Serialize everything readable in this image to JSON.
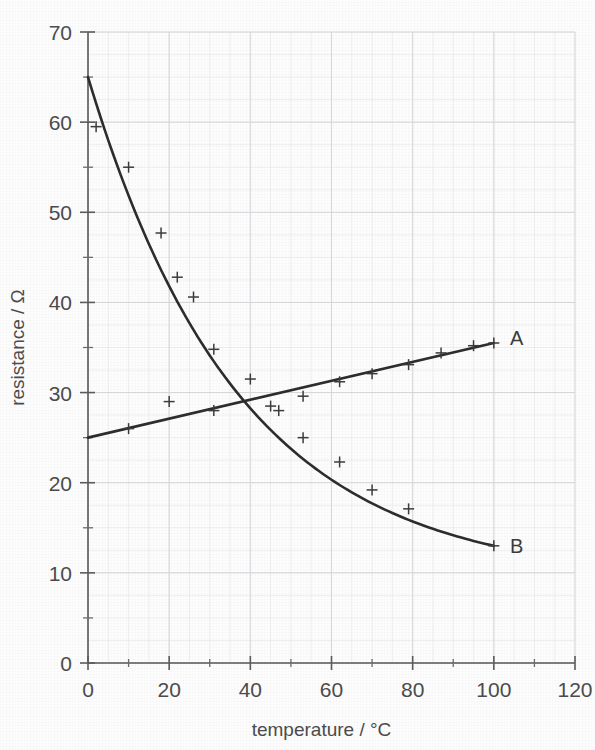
{
  "figure": {
    "background_color": "#fdfdfd",
    "ink_color": "#2b2b2b",
    "axis_color": "#5a5a5a",
    "grid_color": "#d8d8dc"
  },
  "chart_data": {
    "type": "scatter",
    "title": "",
    "subtitle": "",
    "xlabel": "temperature / °C",
    "ylabel": "resistance / Ω",
    "xlim": [
      0,
      120
    ],
    "ylim": [
      0,
      70
    ],
    "xticks": [
      0,
      20,
      40,
      60,
      80,
      100,
      120
    ],
    "xticklabels": [
      "0",
      "20",
      "40",
      "60",
      "80",
      "100",
      "120"
    ],
    "yticks": [
      0,
      10,
      20,
      30,
      40,
      50,
      60,
      70
    ],
    "yticklabels": [
      "0",
      "10",
      "20",
      "30",
      "40",
      "50",
      "60",
      "70"
    ],
    "x_minor_tick_step": 10,
    "y_minor_tick_step": 5,
    "grid": true,
    "grid_style": "faint graph paper",
    "legend": "inline end-of-curve labels",
    "annotations": [
      {
        "text": "A",
        "x": 104,
        "y": 36,
        "series": "A"
      },
      {
        "text": "B",
        "x": 104,
        "y": 13,
        "series": "B"
      }
    ],
    "series": [
      {
        "name": "A",
        "label": "A",
        "marker": "plus",
        "fit": "linear",
        "fit_endpoints": [
          [
            0,
            25.0
          ],
          [
            100,
            35.5
          ]
        ],
        "points": [
          {
            "x": 10,
            "y": 26.0
          },
          {
            "x": 20,
            "y": 29.0
          },
          {
            "x": 31,
            "y": 28.0
          },
          {
            "x": 45,
            "y": 28.5
          },
          {
            "x": 53,
            "y": 29.6
          },
          {
            "x": 62,
            "y": 31.2
          },
          {
            "x": 70,
            "y": 32.1
          },
          {
            "x": 79,
            "y": 33.1
          },
          {
            "x": 87,
            "y": 34.4
          },
          {
            "x": 95,
            "y": 35.2
          },
          {
            "x": 100,
            "y": 35.5
          }
        ]
      },
      {
        "name": "B",
        "label": "B",
        "marker": "plus",
        "fit": "exponential decay",
        "fit_endpoints": [
          [
            0,
            65.0
          ],
          [
            100,
            13.0
          ]
        ],
        "points": [
          {
            "x": 2,
            "y": 59.5
          },
          {
            "x": 10,
            "y": 55.0
          },
          {
            "x": 18,
            "y": 47.7
          },
          {
            "x": 22,
            "y": 42.8
          },
          {
            "x": 26,
            "y": 40.6
          },
          {
            "x": 31,
            "y": 34.8
          },
          {
            "x": 40,
            "y": 31.5
          },
          {
            "x": 47,
            "y": 28.0
          },
          {
            "x": 53,
            "y": 25.0
          },
          {
            "x": 62,
            "y": 22.3
          },
          {
            "x": 70,
            "y": 19.2
          },
          {
            "x": 79,
            "y": 17.1
          },
          {
            "x": 100,
            "y": 13.0
          }
        ]
      }
    ]
  }
}
